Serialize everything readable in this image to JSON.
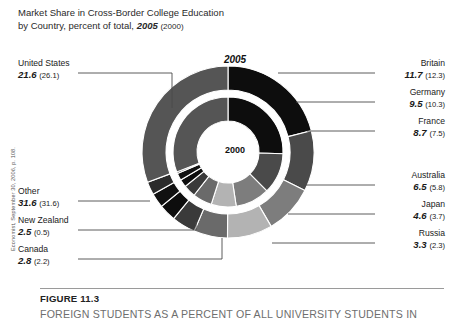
{
  "title": {
    "line1": "Market Share in Cross-Border College Education",
    "line2_prefix": "by Country, percent of total,",
    "line2_year": "2005",
    "line2_paren": "(2000)"
  },
  "source_note": "Economist, September 30, 2006, p. 108.",
  "rings": {
    "outer_year": "2005",
    "inner_year": "2000"
  },
  "caption": {
    "figure_number": "FIGURE 11.3",
    "text": "FOREIGN STUDENTS AS A PERCENT OF ALL UNIVERSITY STUDENTS IN"
  },
  "chart_data": {
    "type": "pie",
    "title": "Market Share in Cross-Border College Education by Country, percent of total, 2005 (2000)",
    "subtype": "nested-donut",
    "unit": "percent of total",
    "legend_position": "callout-labels",
    "categories": [
      "United States",
      "Britain",
      "Germany",
      "France",
      "Australia",
      "Japan",
      "Russia",
      "Canada",
      "New Zealand",
      "Other"
    ],
    "series": [
      {
        "name": "2005",
        "ring": "outer",
        "values": [
          21.6,
          11.7,
          9.5,
          8.7,
          6.5,
          4.6,
          3.3,
          2.8,
          2.5,
          31.6
        ]
      },
      {
        "name": "2000",
        "ring": "inner",
        "values": [
          26.1,
          12.3,
          10.3,
          7.5,
          5.8,
          3.7,
          2.3,
          2.2,
          0.5,
          31.6
        ]
      }
    ],
    "colors": [
      "#0d0d0d",
      "#4a4a4a",
      "#7d7d7d",
      "#b3b3b3",
      "#6a6a6a",
      "#3a3a3a",
      "#0d0d0d",
      "#111111",
      "#2b2b2b",
      "#555555"
    ]
  },
  "callouts": [
    {
      "name": "United States",
      "value": "21.6",
      "prev": "(26.1)",
      "side": "left"
    },
    {
      "name": "Other",
      "value": "31.6",
      "prev": "(31.6)",
      "side": "left"
    },
    {
      "name": "New Zealand",
      "value": "2.5",
      "prev": "(0.5)",
      "side": "left"
    },
    {
      "name": "Canada",
      "value": "2.8",
      "prev": "(2.2)",
      "side": "left"
    },
    {
      "name": "Britain",
      "value": "11.7",
      "prev": "(12.3)",
      "side": "right"
    },
    {
      "name": "Germany",
      "value": "9.5",
      "prev": "(10.3)",
      "side": "right"
    },
    {
      "name": "France",
      "value": "8.7",
      "prev": "(7.5)",
      "side": "right"
    },
    {
      "name": "Australia",
      "value": "6.5",
      "prev": "(5.8)",
      "side": "right"
    },
    {
      "name": "Japan",
      "value": "4.6",
      "prev": "(3.7)",
      "side": "right"
    },
    {
      "name": "Russia",
      "value": "3.3",
      "prev": "(2.3)",
      "side": "right"
    }
  ]
}
